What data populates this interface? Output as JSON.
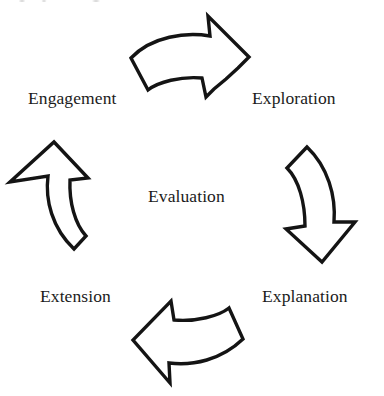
{
  "diagram": {
    "title": "Evaluation",
    "center_label": "Evaluation",
    "scan_artifact": "",
    "background_color": "#ffffff",
    "stroke_color": "#141414",
    "text_color": "#1b1b1b",
    "labels": [
      {
        "id": "engagement",
        "text": "Engagement",
        "position": "top-left"
      },
      {
        "id": "exploration",
        "text": "Exploration",
        "position": "top-right"
      },
      {
        "id": "evaluation",
        "text": "Evaluation",
        "position": "center"
      },
      {
        "id": "extension",
        "text": "Extension",
        "position": "bottom-left"
      },
      {
        "id": "explanation",
        "text": "Explanation",
        "position": "bottom-right"
      }
    ],
    "arrows": [
      {
        "id": "top",
        "direction": "right",
        "from": "engagement",
        "to": "exploration",
        "name": "curved-arrow-right"
      },
      {
        "id": "right",
        "direction": "down",
        "from": "exploration",
        "to": "explanation",
        "name": "curved-arrow-down"
      },
      {
        "id": "bottom",
        "direction": "left",
        "from": "explanation",
        "to": "extension",
        "name": "curved-arrow-left"
      },
      {
        "id": "left",
        "direction": "up",
        "from": "extension",
        "to": "engagement",
        "name": "curved-arrow-up"
      }
    ],
    "cycle_direction": "clockwise"
  }
}
